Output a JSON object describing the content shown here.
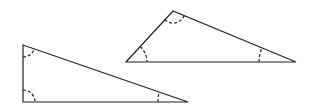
{
  "diagram": {
    "stroke_color": "#222222",
    "background": "#ffffff",
    "triangles": [
      {
        "name": "right-triangle",
        "vertices": [
          [
            23,
            45
          ],
          [
            23,
            102
          ],
          [
            188,
            102
          ]
        ],
        "angle_marks": [
          {
            "vertex": [
              23,
              45
            ],
            "radius": 12
          },
          {
            "vertex": [
              23,
              102
            ],
            "radius": 12
          },
          {
            "vertex": [
              188,
              102
            ],
            "radius": 30
          }
        ]
      },
      {
        "name": "obtuse-triangle",
        "vertices": [
          [
            173,
            11
          ],
          [
            126,
            62
          ],
          [
            296,
            62
          ]
        ],
        "angle_marks": [
          {
            "vertex": [
              173,
              11
            ],
            "radius": 12
          },
          {
            "vertex": [
              126,
              62
            ],
            "radius": 21
          },
          {
            "vertex": [
              296,
              62
            ],
            "radius": 37
          }
        ]
      }
    ]
  }
}
